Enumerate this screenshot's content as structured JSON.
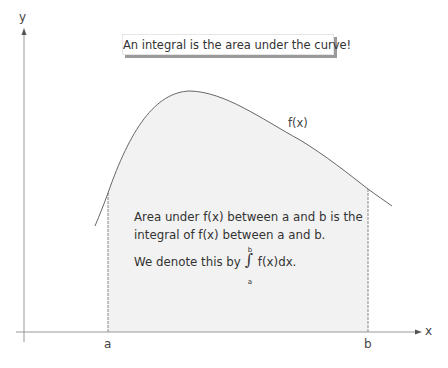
{
  "title": "An integral is the area under the curve!",
  "axes": {
    "x_label": "x",
    "y_label": "y"
  },
  "bounds": {
    "lower": "a",
    "upper": "b"
  },
  "curve_label": "f(x)",
  "description": {
    "line1": "Area under f(x) between a and b is the",
    "line2": "integral of f(x) between a and b.",
    "line3_prefix": "We denote this by",
    "integral_symbol": "∫",
    "integral_upper": "b",
    "integral_lower": "a",
    "line3_suffix": "f(x)dx."
  },
  "colors": {
    "shade": "#f2f2f2",
    "axis": "#888888",
    "curve": "#666666",
    "shadow": "#9a9a9a"
  }
}
